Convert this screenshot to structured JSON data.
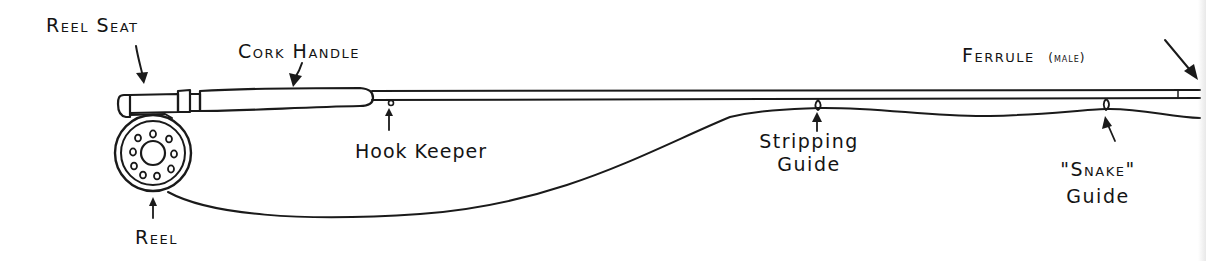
{
  "diagram": {
    "ink_color": "#1a1a1a",
    "background": "#ffffff",
    "labels": {
      "reel_seat": "Reel Seat",
      "cork_handle": "Cork Handle",
      "hook_keeper": "Hook Keeper",
      "reel": "Reel",
      "stripping_guide_line1": "Stripping",
      "stripping_guide_line2": "Guide",
      "snake_guide_line1": "\"Snake\"",
      "snake_guide_line2": "Guide",
      "ferrule": "Ferrule",
      "ferrule_qualifier": "(male)"
    },
    "parts": [
      {
        "id": "reel-seat",
        "label": "Reel Seat"
      },
      {
        "id": "cork-handle",
        "label": "Cork Handle"
      },
      {
        "id": "hook-keeper",
        "label": "Hook Keeper"
      },
      {
        "id": "reel",
        "label": "Reel"
      },
      {
        "id": "stripping-guide",
        "label": "Stripping Guide"
      },
      {
        "id": "snake-guide",
        "label": "\"Snake\" Guide"
      },
      {
        "id": "ferrule",
        "label": "Ferrule (male)"
      }
    ]
  }
}
